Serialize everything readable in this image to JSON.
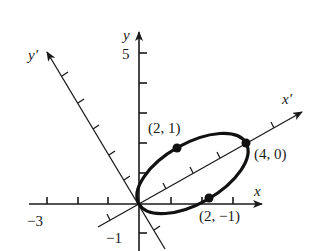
{
  "figure": {
    "type": "rotated-axes-ellipse",
    "colors": {
      "ink": "#1a1a1a",
      "background": "#ffffff"
    },
    "axes": {
      "x": {
        "label": "x",
        "tick_labels": {
          "negative": "−3"
        }
      },
      "y": {
        "label": "y",
        "tick_labels": {
          "top": "5",
          "negative": "−1"
        }
      },
      "x_prime": {
        "label": "x′"
      },
      "y_prime": {
        "label": "y′"
      }
    },
    "points": [
      {
        "id": "p21",
        "label": "(2, 1)"
      },
      {
        "id": "p40",
        "label": "(4, 0)"
      },
      {
        "id": "p2m1",
        "label": "(2, −1)"
      }
    ],
    "ellipse": {
      "center_xprime": 2,
      "semi_major": 2,
      "semi_minor": 1,
      "rotated_frame": "x'y'"
    }
  }
}
